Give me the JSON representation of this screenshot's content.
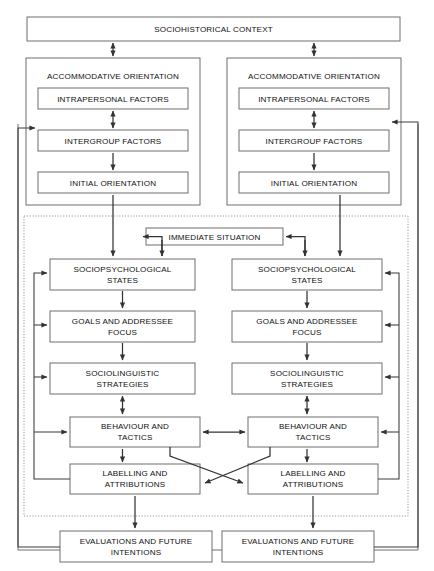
{
  "diagram": {
    "type": "flowchart",
    "colors": {
      "box_border": "#6e6e6e",
      "connector": "#333333",
      "dotted_border": "#9a9a9a",
      "background": "#ffffff",
      "text": "#111111"
    },
    "top": {
      "sociohistorical_context": "SOCIOHISTORICAL CONTEXT"
    },
    "columns": [
      {
        "side": "left",
        "accommodative_orientation": "ACCOMMODATIVE ORIENTATION",
        "orientation_items": [
          "INTRAPERSONAL FACTORS",
          "INTERGROUP FACTORS",
          "INITIAL ORIENTATION"
        ],
        "situation_items": [
          "SOCIOPSYCHOLOGICAL\nSTATES",
          "GOALS AND ADDRESSEE\nFOCUS",
          "SOCIOLINGUISTIC\nSTRATEGIES",
          "BEHAVIOUR AND\nTACTICS",
          "LABELLING AND\nATTRIBUTIONS"
        ],
        "evaluations": "EVALUATIONS AND FUTURE\nINTENTIONS"
      },
      {
        "side": "right",
        "accommodative_orientation": "ACCOMMODATIVE ORIENTATION",
        "orientation_items": [
          "INTRAPERSONAL FACTORS",
          "INTERGROUP FACTORS",
          "INITIAL ORIENTATION"
        ],
        "situation_items": [
          "SOCIOPSYCHOLOGICAL\nSTATES",
          "GOALS AND ADDRESSEE\nFOCUS",
          "SOCIOLINGUISTIC\nSTRATEGIES",
          "BEHAVIOUR AND\nTACTICS",
          "LABELLING AND\nATTRIBUTIONS"
        ],
        "evaluations": "EVALUATIONS AND FUTURE\nINTENTIONS"
      }
    ],
    "shared": {
      "immediate_situation": "IMMEDIATE SITUATION"
    },
    "labels": {
      "sociohistorical_context": "SOCIOHISTORICAL CONTEXT",
      "accommodative_orientation": "ACCOMMODATIVE ORIENTATION",
      "intrapersonal_factors": "INTRAPERSONAL FACTORS",
      "intergroup_factors": "INTERGROUP FACTORS",
      "initial_orientation": "INITIAL ORIENTATION",
      "immediate_situation": "IMMEDIATE SITUATION",
      "sociopsychological_states_l1": "SOCIOPSYCHOLOGICAL",
      "sociopsychological_states_l2": "STATES",
      "goals_addressee_l1": "GOALS AND ADDRESSEE",
      "goals_addressee_l2": "FOCUS",
      "sociolinguistic_strategies_l1": "SOCIOLINGUISTIC",
      "sociolinguistic_strategies_l2": "STRATEGIES",
      "behaviour_tactics_l1": "BEHAVIOUR AND",
      "behaviour_tactics_l2": "TACTICS",
      "labelling_attributions_l1": "LABELLING AND",
      "labelling_attributions_l2": "ATTRIBUTIONS",
      "evaluations_intentions_l1": "EVALUATIONS AND FUTURE",
      "evaluations_intentions_l2": "INTENTIONS"
    }
  }
}
